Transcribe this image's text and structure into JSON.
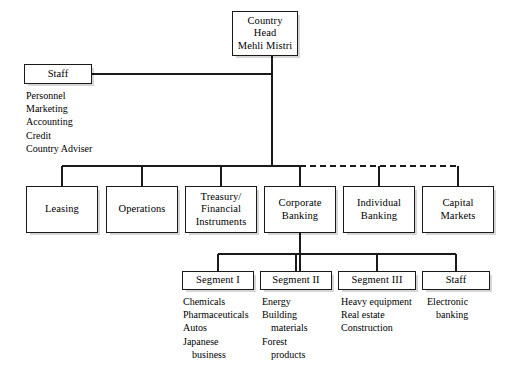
{
  "chart_data": {
    "type": "diagram",
    "nodes": {
      "country_head": "Country\nHead\nMehli Mistri",
      "staff_top": "Staff",
      "leasing": "Leasing",
      "operations": "Operations",
      "treasury": "Treasury/\nFinancial\nInstruments",
      "corporate_banking": "Corporate\nBanking",
      "individual_banking": "Individual\nBanking",
      "capital_markets": "Capital\nMarkets",
      "segment_1": "Segment I",
      "segment_2": "Segment II",
      "segment_3": "Segment III",
      "staff_segment": "Staff"
    },
    "lists": {
      "staff_top": [
        {
          "text": "Personnel",
          "indent": false
        },
        {
          "text": "Marketing",
          "indent": false
        },
        {
          "text": "Accounting",
          "indent": false
        },
        {
          "text": "Credit",
          "indent": false
        },
        {
          "text": "Country Adviser",
          "indent": false
        }
      ],
      "segment_1": [
        {
          "text": "Chemicals",
          "indent": false
        },
        {
          "text": "Pharmaceuticals",
          "indent": false
        },
        {
          "text": "Autos",
          "indent": false
        },
        {
          "text": "Japanese",
          "indent": false
        },
        {
          "text": "business",
          "indent": true
        }
      ],
      "segment_2": [
        {
          "text": "Energy",
          "indent": false
        },
        {
          "text": "Building",
          "indent": false
        },
        {
          "text": "materials",
          "indent": true
        },
        {
          "text": "Forest",
          "indent": false
        },
        {
          "text": "products",
          "indent": true
        }
      ],
      "segment_3": [
        {
          "text": "Heavy equipment",
          "indent": false
        },
        {
          "text": "Real estate",
          "indent": false
        },
        {
          "text": "Construction",
          "indent": false
        }
      ],
      "staff_segment": [
        {
          "text": "Electronic",
          "indent": false
        },
        {
          "text": "banking",
          "indent": true
        }
      ]
    },
    "edges": [
      {
        "from": "country_head",
        "to": "staff_top",
        "style": "solid"
      },
      {
        "from": "country_head",
        "to": "leasing",
        "style": "solid"
      },
      {
        "from": "country_head",
        "to": "operations",
        "style": "solid"
      },
      {
        "from": "country_head",
        "to": "treasury",
        "style": "solid"
      },
      {
        "from": "country_head",
        "to": "corporate_banking",
        "style": "solid"
      },
      {
        "from": "country_head",
        "to": "individual_banking",
        "style": "dashed"
      },
      {
        "from": "country_head",
        "to": "capital_markets",
        "style": "dashed"
      },
      {
        "from": "corporate_banking",
        "to": "segment_1",
        "style": "solid"
      },
      {
        "from": "corporate_banking",
        "to": "segment_2",
        "style": "solid"
      },
      {
        "from": "corporate_banking",
        "to": "segment_3",
        "style": "solid"
      },
      {
        "from": "corporate_banking",
        "to": "staff_segment",
        "style": "solid"
      }
    ],
    "colors": {
      "background": "#ffffff",
      "box_border": "#1a1a1a",
      "box_fill": "#ffffff",
      "connector": "#1a1a1a",
      "shadow": "#cccccc",
      "text": "#000000"
    }
  },
  "watermark": {
    "text": ""
  }
}
